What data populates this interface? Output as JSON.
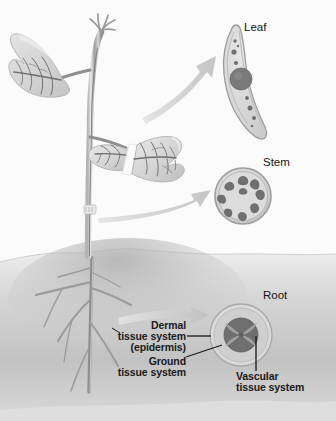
{
  "figure": {
    "name": "plant-tissue-systems-diagram",
    "background_color": "#fbfbfb",
    "width": 336,
    "height": 421
  },
  "organ_labels": {
    "leaf": "Leaf",
    "stem": "Stem",
    "root": "Root"
  },
  "tissue_callouts": {
    "dermal": {
      "line1": "Dermal",
      "line2": "tissue system",
      "line3": "(epidermis)"
    },
    "ground": {
      "line1": "Ground",
      "line2": "tissue system"
    },
    "vascular": {
      "line1": "Vascular",
      "line2": "tissue system"
    }
  },
  "colors": {
    "text": "#1a1a1a",
    "soil_light": "#f0f0f0",
    "soil_dark": "#b9b9b9",
    "plant_stem": "#8c8c8c",
    "plant_stem_light": "#cfcfcf",
    "leaf_fill": "#d8d8d8",
    "leaf_vein": "#6f6f6f",
    "arrow": "#c9c9c9",
    "section_outline": "#9a9a9a",
    "section_fill": "#d2d2d2",
    "ground_fill": "#c0c0c0",
    "vascular_dark": "#6e6e6e",
    "leader_line": "#1a1a1a"
  },
  "cross_sections": {
    "leaf": {
      "type": "leaf-blade-cross-section",
      "midrib_bundles": 1,
      "minor_bundles": 8,
      "shape": "curved-elongated-blade"
    },
    "stem": {
      "type": "stem-cross-section",
      "vascular_bundle_count": 9,
      "arrangement": "ring",
      "shape": "circle"
    },
    "root": {
      "type": "root-cross-section",
      "layers": [
        "dermal (epidermis)",
        "ground",
        "vascular"
      ],
      "vascular_shape": "four-pointed-star-stele",
      "shape": "circle"
    }
  },
  "plant": {
    "leaves": 2,
    "apical_bud": true,
    "soil_line_y": 256,
    "root_branches": 7
  }
}
